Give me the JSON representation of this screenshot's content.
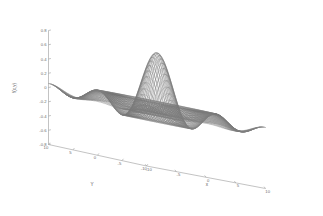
{
  "figure": {
    "background_color": "#ffffff",
    "axis_color": "#9a9a9a",
    "tick_label_color": "#6d6d6d",
    "mesh_color": "#3a3a3a"
  },
  "chart_data": {
    "type": "line",
    "render_style": "3d-wireframe-mesh-surface",
    "title": "",
    "subtitle": "",
    "xlabel": "x",
    "ylabel": "Y",
    "zlabel": "f(x,y)",
    "grid": false,
    "legend": null,
    "legend_position": "none",
    "xlim": [
      -10,
      10
    ],
    "ylim": [
      -10,
      10
    ],
    "zlim": [
      -0.8,
      0.8
    ],
    "x_ticks": [
      -10,
      -5,
      0,
      5,
      10
    ],
    "x_tick_labels": [
      "-10",
      "-5",
      "0",
      "5",
      "10"
    ],
    "y_ticks": [
      10,
      5,
      0,
      -5,
      -10
    ],
    "y_tick_labels": [
      "10",
      "5",
      "0",
      "-5",
      "-10"
    ],
    "z_ticks": [
      0.8,
      0.6,
      0.4,
      0.2,
      0,
      -0.2,
      -0.4,
      -0.6,
      -0.8
    ],
    "z_tick_labels": [
      "0.8",
      "0.6",
      "0.4",
      "0.2",
      "0",
      "-0.2",
      "-0.4",
      "-0.6",
      "-0.8"
    ],
    "surface_function": "sin(sqrt(x^2+y^2))/sqrt(x^2+y^2) style damped radial wave",
    "mesh_resolution": {
      "nx": 81,
      "ny": 81
    },
    "view": {
      "azimuth": -37.5,
      "elevation": 30
    },
    "z_max_observed": 0.8,
    "z_min_observed": -0.8,
    "series": [
      {
        "name": "f(x,y)",
        "description": "Damped radial sinusoid surface with central twin ridges and outer trough"
      }
    ]
  }
}
